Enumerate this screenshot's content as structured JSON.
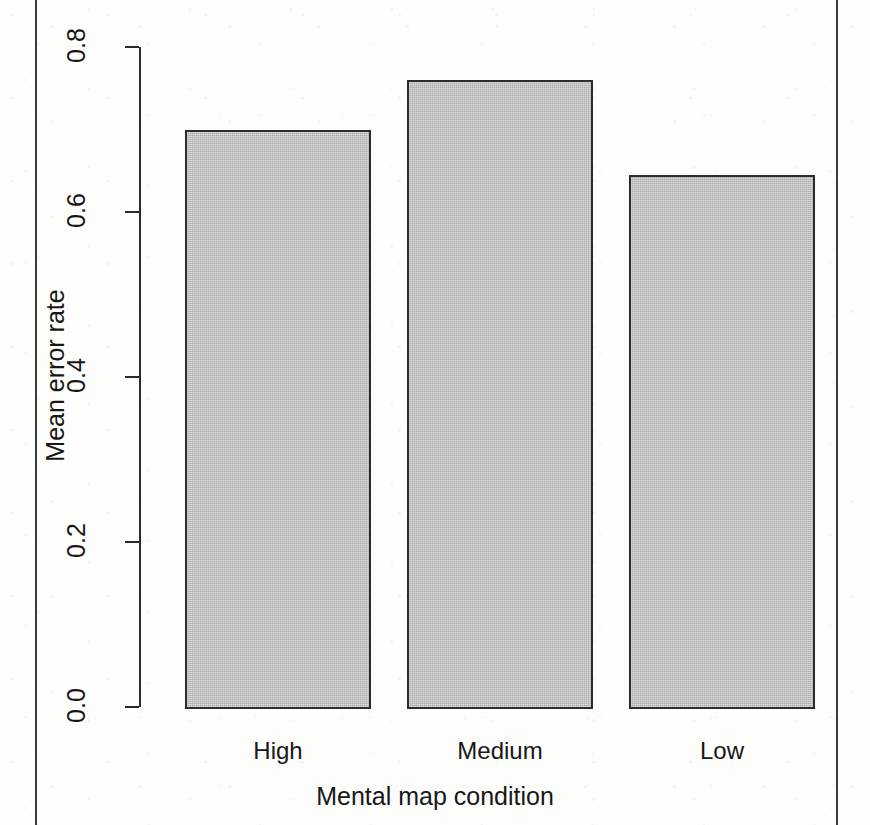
{
  "figure": {
    "background_color": "#fdfdfc",
    "bar_fill_color": "#bcbcbc",
    "bar_border_color": "#2b2b2b",
    "axis_color": "#2b2b2b",
    "text_color": "#171717"
  },
  "chart_data": {
    "type": "bar",
    "title": "",
    "subtitle": "",
    "categories": [
      "High",
      "Medium",
      "Low"
    ],
    "values": [
      0.7,
      0.76,
      0.645
    ],
    "series": [
      {
        "name": "Mean error rate",
        "values": [
          0.7,
          0.76,
          0.645
        ]
      }
    ],
    "xlabel": "Mental map condition",
    "ylabel": "Mean error rate",
    "ylim": [
      0.0,
      0.8
    ],
    "xlim": [
      0,
      3
    ],
    "yticks": [
      0.0,
      0.2,
      0.4,
      0.6,
      0.8
    ],
    "ytick_labels": [
      "0.0",
      "0.2",
      "0.4",
      "0.6",
      "0.8"
    ],
    "grid": false,
    "legend": false,
    "legend_position": "none",
    "annotations": []
  },
  "axes": {
    "y_title": "Mean error rate",
    "x_title": "Mental map condition",
    "y_tick_labels": [
      "0.0",
      "0.2",
      "0.4",
      "0.6",
      "0.8"
    ],
    "x_tick_labels": [
      "High",
      "Medium",
      "Low"
    ]
  }
}
